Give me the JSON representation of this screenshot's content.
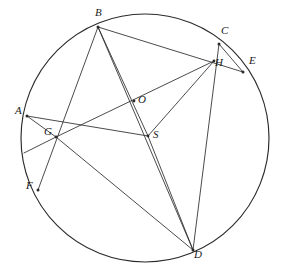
{
  "figure": {
    "kind": "circle-geometry-diagram",
    "stroke_color": "#2b2b2b",
    "background_color": "#ffffff",
    "label_color": "#1a1a1a",
    "canvas": {
      "width": 281,
      "height": 278
    }
  },
  "chart_data": {
    "type": "scatter",
    "xlabel": "",
    "ylabel": "",
    "grid": false,
    "legend": "none",
    "xlim": [
      0,
      281
    ],
    "ylim": [
      0,
      278
    ],
    "circle": {
      "cx": 145,
      "cy": 138,
      "r": 124
    },
    "categories": [
      "A",
      "B",
      "C",
      "D",
      "E",
      "F",
      "G",
      "H",
      "O",
      "S"
    ],
    "points": [
      {
        "name": "A",
        "x": 27,
        "y": 116,
        "on_circle": true,
        "label_dx": -12,
        "label_dy": -5
      },
      {
        "name": "B",
        "x": 98,
        "y": 27,
        "on_circle": true,
        "label_dx": -3,
        "label_dy": -14
      },
      {
        "name": "C",
        "x": 219,
        "y": 44,
        "on_circle": true,
        "label_dx": 2,
        "label_dy": -13
      },
      {
        "name": "D",
        "x": 193,
        "y": 250,
        "on_circle": true,
        "label_dx": 1,
        "label_dy": 5
      },
      {
        "name": "E",
        "x": 243,
        "y": 72,
        "on_circle": true,
        "label_dx": 6,
        "label_dy": -11
      },
      {
        "name": "F",
        "x": 38,
        "y": 190,
        "on_circle": true,
        "label_dx": -12,
        "label_dy": -4
      },
      {
        "name": "G",
        "x": 56,
        "y": 137,
        "on_circle": false,
        "label_dx": -12,
        "label_dy": -5
      },
      {
        "name": "H",
        "x": 214,
        "y": 61,
        "on_circle": false,
        "label_dx": 1,
        "label_dy": 2
      },
      {
        "name": "O",
        "x": 134,
        "y": 101,
        "on_circle": false,
        "label_dx": 4,
        "label_dy": -1
      },
      {
        "name": "S",
        "x": 148,
        "y": 136,
        "on_circle": false,
        "label_dx": 5,
        "label_dy": -1
      }
    ],
    "segments": [
      {
        "from": "B",
        "to": "F",
        "note": "passes through G"
      },
      {
        "from": "B",
        "to": "E",
        "note": "passes through H"
      },
      {
        "from": "B",
        "to": "S"
      },
      {
        "from": "B",
        "to": "D",
        "note": "passes near O"
      },
      {
        "from": "A",
        "to": "S"
      },
      {
        "from": "A",
        "to": "G"
      },
      {
        "from": "G",
        "to": "H",
        "note": "passes through O"
      },
      {
        "from": "G",
        "to": "D"
      },
      {
        "from": "C",
        "to": "D",
        "note": "passes through H"
      },
      {
        "from": "C",
        "to": "E"
      },
      {
        "from": "S",
        "to": "H"
      },
      {
        "from": "S",
        "to": "D"
      },
      {
        "from": "G",
        "to": "ARC_LOWER_LEFT",
        "x2": 24,
        "y2": 153,
        "note": "short chord from G to circle"
      }
    ]
  },
  "labels": {
    "A": "A",
    "B": "B",
    "C": "C",
    "D": "D",
    "E": "E",
    "F": "F",
    "G": "G",
    "H": "H",
    "O": "O",
    "S": "S"
  }
}
